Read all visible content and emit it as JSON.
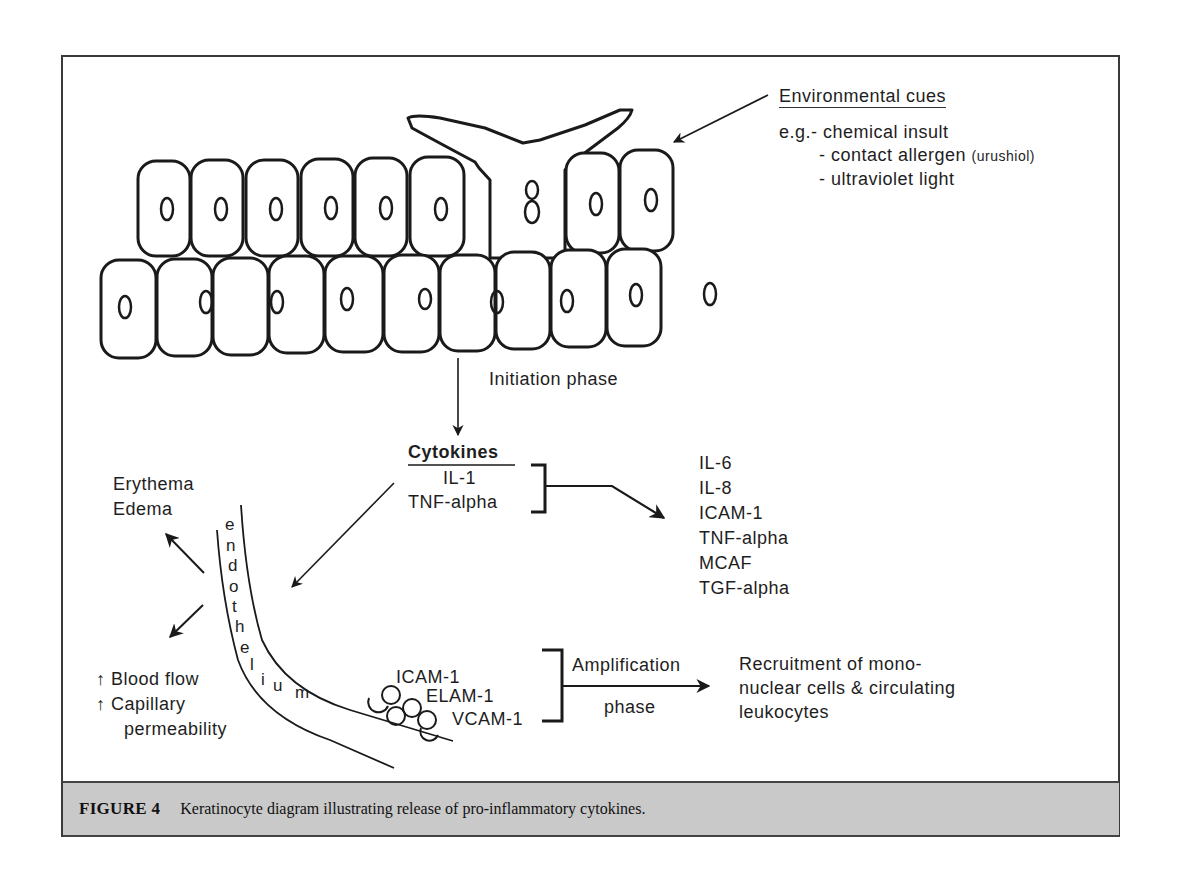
{
  "environmental_cues": {
    "title": "Environmental cues",
    "prefix": "e.g.",
    "items": [
      {
        "text": "- chemical insult",
        "note": ""
      },
      {
        "text": "- contact allergen",
        "note": "(urushiol)"
      },
      {
        "text": "- ultraviolet light",
        "note": ""
      }
    ]
  },
  "initiation": {
    "label": "Initiation phase"
  },
  "cytokines": {
    "title": "Cytokines",
    "items": [
      "IL-1",
      "TNF-alpha"
    ]
  },
  "induced_mediators": {
    "items": [
      "IL-6",
      "IL-8",
      "ICAM-1",
      "TNF-alpha",
      "MCAF",
      "TGF-alpha"
    ]
  },
  "vascular_effects": {
    "top": [
      "Erythema",
      "Edema"
    ],
    "bottom": [
      {
        "arrow": "↑",
        "text": "Blood flow"
      },
      {
        "arrow": "↑",
        "text": "Capillary"
      },
      {
        "arrow": "",
        "text": "permeability"
      }
    ]
  },
  "endothelium": {
    "letters": [
      "e",
      "n",
      "d",
      "o",
      "t",
      "h",
      "e",
      "l",
      "i",
      "u",
      "m"
    ]
  },
  "adhesion_molecules": [
    "ICAM-1",
    "ELAM-1",
    "VCAM-1"
  ],
  "amplification": {
    "line1": "Amplification",
    "line2": "phase"
  },
  "outcome": {
    "lines": [
      "Recruitment of mono-",
      "nuclear cells & circulating",
      "leukocytes"
    ]
  },
  "caption": {
    "figure_number": "FIGURE 4",
    "text": "Keratinocyte diagram illustrating release of pro-inflammatory cytokines."
  },
  "colors": {
    "line": "#1a1a1a",
    "caption_bg": "#c9c9c9",
    "frame": "#3a3a3a"
  }
}
